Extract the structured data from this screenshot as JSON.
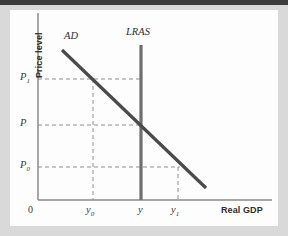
{
  "figure": {
    "kind": "economics-ad-lras-diagram",
    "background_color": "#d9d9d9",
    "panel_color": "#fdfdfd",
    "top_strip_color": "#3c3c3c"
  },
  "axes": {
    "y_axis_title": "Price level",
    "x_axis_title": "Real GDP",
    "origin_label": "0",
    "axis_color": "#8a8a8a",
    "y_ticks": [
      {
        "id": "p1",
        "label": "P",
        "sub": "1",
        "y_px": 79
      },
      {
        "id": "p",
        "label": "P",
        "sub": "",
        "y_px": 125
      },
      {
        "id": "p0",
        "label": "P",
        "sub": "0",
        "y_px": 167
      }
    ],
    "x_ticks": [
      {
        "id": "y0",
        "label": "y",
        "sub": "0",
        "x_px": 93
      },
      {
        "id": "y",
        "label": "y",
        "sub": "",
        "x_px": 141
      },
      {
        "id": "y1",
        "label": "y",
        "sub": "1",
        "x_px": 178
      }
    ]
  },
  "curves": [
    {
      "id": "ad",
      "label": "AD",
      "name": "aggregate-demand-curve",
      "color": "#4a4a4a",
      "width": 3.2,
      "x1": 62,
      "y1": 50,
      "x2": 206,
      "y2": 188,
      "label_x": 64,
      "label_y": 37
    },
    {
      "id": "lras",
      "label": "LRAS",
      "name": "long-run-aggregate-supply-curve",
      "color": "#6e6e6e",
      "width": 3.2,
      "x1": 141,
      "y1": 45,
      "x2": 141,
      "y2": 200,
      "label_x": 126,
      "label_y": 33
    }
  ],
  "guides": {
    "color": "#909090",
    "dash": "4,3",
    "horizontal": [
      {
        "id": "p1-guide",
        "y": 79,
        "x_from": 38,
        "x_to": 141
      },
      {
        "id": "p-guide",
        "y": 125,
        "x_from": 38,
        "x_to": 141
      },
      {
        "id": "p0-guide",
        "y": 167,
        "x_from": 38,
        "x_to": 180
      }
    ],
    "vertical": [
      {
        "id": "y0-guide",
        "x": 93,
        "y_from": 79,
        "y_to": 200
      },
      {
        "id": "y1-guide",
        "x": 178,
        "y_from": 167,
        "y_to": 200
      }
    ]
  },
  "geometry": {
    "y_axis_x": 38,
    "y_axis_top": 13,
    "x_axis_y": 200,
    "x_axis_right": 272
  },
  "chart_data": {
    "type": "line",
    "title": "",
    "xlabel": "Real GDP",
    "ylabel": "Price level",
    "grid": false,
    "legend": "inline-curve-labels",
    "xlim": [
      0,
      1
    ],
    "ylim": [
      0,
      1
    ],
    "xtick_labels": [
      "0",
      "y0",
      "y",
      "y1"
    ],
    "ytick_labels": [
      "P0",
      "P",
      "P1"
    ],
    "series": [
      {
        "name": "AD",
        "type": "line",
        "description": "Downward-sloping aggregate demand curve",
        "points": [
          {
            "x_label": "",
            "y_label": ""
          },
          {
            "x_label": "y0",
            "y_label": "P1"
          },
          {
            "x_label": "y",
            "y_label": "P"
          },
          {
            "x_label": "y1",
            "y_label": "P0"
          }
        ]
      },
      {
        "name": "LRAS",
        "type": "vertical-line",
        "description": "Vertical long-run aggregate supply at potential output y",
        "x_label": "y"
      }
    ],
    "annotations": [
      {
        "text": "AD",
        "kind": "curve-label"
      },
      {
        "text": "LRAS",
        "kind": "curve-label"
      },
      {
        "text": "Equilibrium at (y, P) where AD crosses LRAS",
        "kind": "implied"
      }
    ]
  }
}
